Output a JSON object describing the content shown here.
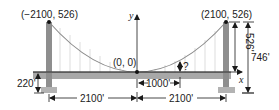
{
  "diagram": {
    "type": "suspension-bridge-parabola",
    "points": {
      "left_top": "(−2100, 526)",
      "right_top": "(2100, 526)",
      "origin": "(0, 0)"
    },
    "axes": {
      "x": "x",
      "y": "y"
    },
    "dimensions": {
      "cable_height": "526'",
      "tower_height": "746'",
      "deck_height": "220'",
      "offset": "1000'",
      "half_span_left": "2100'",
      "half_span_right": "2100'",
      "unknown": "?"
    },
    "colors": {
      "tower": "#8c8c8c",
      "deck": "#a6a6a6",
      "cable": "#8a8a8a",
      "suspender": "#c8c8c8",
      "footing": "#b0b0b0",
      "ink": "#1a1a1a"
    }
  }
}
